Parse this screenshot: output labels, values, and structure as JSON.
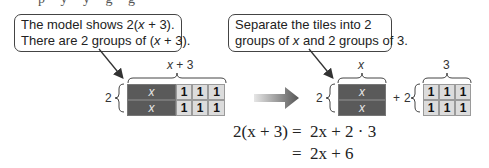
{
  "top_fragment": "p y y g g",
  "callouts": [
    {
      "line1_pre": "The model shows 2(",
      "line1_var": "x",
      "line1_post": " + 3).",
      "line2_pre": "There are 2 groups of (",
      "line2_var": "x",
      "line2_post": " + 3)."
    },
    {
      "line1": "Separate the tiles into 2",
      "line2_pre": "groups of ",
      "line2_var": "x",
      "line2_post": " and 2 groups of 3."
    }
  ],
  "left_model": {
    "top_label_var": "x",
    "top_label_rest": " + 3",
    "side_label": "2",
    "rows": [
      {
        "x_tile": "x",
        "ones": [
          "1",
          "1",
          "1"
        ]
      },
      {
        "x_tile": "x",
        "ones": [
          "1",
          "1",
          "1"
        ]
      }
    ]
  },
  "arrow": "right-arrow",
  "right_model": {
    "x_group": {
      "top_label": "x",
      "side_label": "2",
      "tiles": [
        "x",
        "x"
      ]
    },
    "plus": "+",
    "ones_group": {
      "top_label": "3",
      "side_label": "2",
      "rows": [
        [
          "1",
          "1",
          "1"
        ],
        [
          "1",
          "1",
          "1"
        ]
      ]
    }
  },
  "equations": [
    {
      "lhs": "2(x + 3)",
      "eq": "=",
      "rhs": "2x + 2 · 3"
    },
    {
      "lhs": "",
      "eq": "=",
      "rhs": "2x + 6"
    }
  ],
  "colors": {
    "x_tile": "#5a5a5a",
    "one_tile": "#dcdcdc",
    "callout_border": "#444444"
  }
}
